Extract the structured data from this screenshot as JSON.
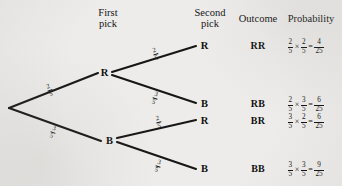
{
  "diagram": {
    "title_headers": {
      "first_pick": "First\npick",
      "second_pick": "Second\npick",
      "outcome": "Outcome",
      "probability": "Probability"
    },
    "colors": {
      "ink": "#141414",
      "background": "#edecea"
    },
    "root": {
      "label": ""
    },
    "first_level": [
      {
        "id": "r1",
        "label": "R",
        "prob_num": "2",
        "prob_den": "5"
      },
      {
        "id": "b1",
        "label": "B",
        "prob_num": "3",
        "prob_den": "5"
      }
    ],
    "second_level": [
      {
        "id": "rr",
        "label": "R",
        "prob_num": "2",
        "prob_den": "5"
      },
      {
        "id": "rb",
        "label": "B",
        "prob_num": "3",
        "prob_den": "5"
      },
      {
        "id": "br",
        "label": "R",
        "prob_num": "2",
        "prob_den": "5"
      },
      {
        "id": "bb",
        "label": "B",
        "prob_num": "3",
        "prob_den": "5"
      }
    ],
    "rows": [
      {
        "outcome": "RR",
        "factor1": {
          "num": "2",
          "den": "5"
        },
        "factor2": {
          "num": "2",
          "den": "5"
        },
        "result": {
          "num": "4",
          "den": "25"
        },
        "times": "×",
        "equals": "="
      },
      {
        "outcome": "RB",
        "factor1": {
          "num": "2",
          "den": "5"
        },
        "factor2": {
          "num": "3",
          "den": "5"
        },
        "result": {
          "num": "6",
          "den": "25"
        },
        "times": "×",
        "equals": "="
      },
      {
        "outcome": "BR",
        "factor1": {
          "num": "3",
          "den": "5"
        },
        "factor2": {
          "num": "2",
          "den": "5"
        },
        "result": {
          "num": "6",
          "den": "25"
        },
        "times": "×",
        "equals": "="
      },
      {
        "outcome": "BB",
        "factor1": {
          "num": "3",
          "den": "5"
        },
        "factor2": {
          "num": "3",
          "den": "5"
        },
        "result": {
          "num": "9",
          "den": "25"
        },
        "times": "×",
        "equals": "="
      }
    ]
  }
}
